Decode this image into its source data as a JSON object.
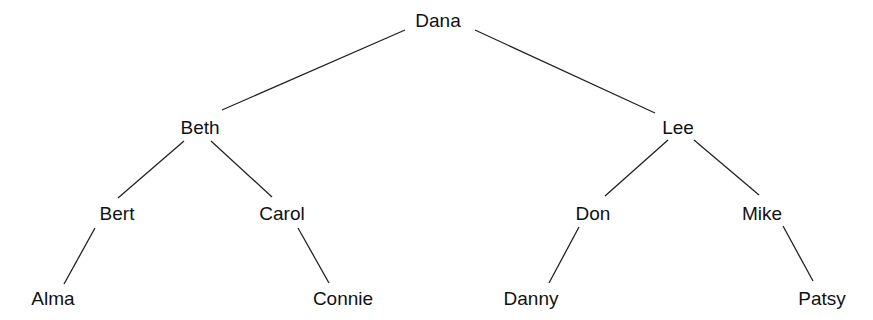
{
  "diagram": {
    "type": "tree",
    "nodes": [
      {
        "id": "dana",
        "label": "Dana",
        "x": 438,
        "y": 20
      },
      {
        "id": "beth",
        "label": "Beth",
        "x": 200,
        "y": 127
      },
      {
        "id": "lee",
        "label": "Lee",
        "x": 678,
        "y": 127
      },
      {
        "id": "bert",
        "label": "Bert",
        "x": 117,
        "y": 213
      },
      {
        "id": "carol",
        "label": "Carol",
        "x": 282,
        "y": 213
      },
      {
        "id": "don",
        "label": "Don",
        "x": 593,
        "y": 213
      },
      {
        "id": "mike",
        "label": "Mike",
        "x": 762,
        "y": 213
      },
      {
        "id": "alma",
        "label": "Alma",
        "x": 53,
        "y": 298
      },
      {
        "id": "connie",
        "label": "Connie",
        "x": 343,
        "y": 298
      },
      {
        "id": "danny",
        "label": "Danny",
        "x": 531,
        "y": 298
      },
      {
        "id": "patsy",
        "label": "Patsy",
        "x": 822,
        "y": 298
      }
    ],
    "edges": [
      {
        "from": "dana",
        "to": "beth",
        "x1": 405,
        "y1": 30,
        "x2": 222,
        "y2": 110
      },
      {
        "from": "dana",
        "to": "lee",
        "x1": 475,
        "y1": 30,
        "x2": 655,
        "y2": 113
      },
      {
        "from": "beth",
        "to": "bert",
        "x1": 184,
        "y1": 141,
        "x2": 118,
        "y2": 198
      },
      {
        "from": "beth",
        "to": "carol",
        "x1": 211,
        "y1": 141,
        "x2": 272,
        "y2": 197
      },
      {
        "from": "bert",
        "to": "alma",
        "x1": 95,
        "y1": 228,
        "x2": 64,
        "y2": 284
      },
      {
        "from": "carol",
        "to": "connie",
        "x1": 298,
        "y1": 228,
        "x2": 329,
        "y2": 283
      },
      {
        "from": "lee",
        "to": "don",
        "x1": 668,
        "y1": 140,
        "x2": 605,
        "y2": 196
      },
      {
        "from": "lee",
        "to": "mike",
        "x1": 694,
        "y1": 140,
        "x2": 759,
        "y2": 195
      },
      {
        "from": "don",
        "to": "danny",
        "x1": 579,
        "y1": 227,
        "x2": 549,
        "y2": 283
      },
      {
        "from": "mike",
        "to": "patsy",
        "x1": 783,
        "y1": 226,
        "x2": 813,
        "y2": 281
      }
    ]
  }
}
